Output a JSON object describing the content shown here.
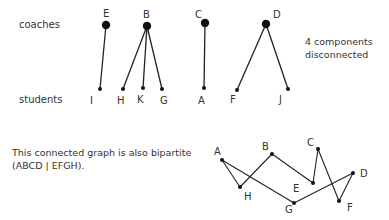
{
  "top": {
    "row_labels": {
      "coaches": "coaches",
      "students": "students"
    },
    "note_lines": [
      "4 components",
      "disconnected"
    ],
    "components": [
      {
        "coach": "E",
        "students": [
          "I"
        ]
      },
      {
        "coach": "B",
        "students": [
          "H",
          "K",
          "G"
        ]
      },
      {
        "coach": "C",
        "students": [
          "A"
        ]
      },
      {
        "coach": "D",
        "students": [
          "F",
          "J"
        ]
      }
    ],
    "node_labels": {
      "E": "E",
      "B": "B",
      "C": "C",
      "D": "D",
      "I": "I",
      "H": "H",
      "K": "K",
      "G": "G",
      "A": "A",
      "F": "F",
      "J": "J"
    }
  },
  "bottom": {
    "caption_lines": [
      "This connected graph is also bipartite",
      "(ABCD | EFGH)."
    ],
    "node_labels": {
      "A": "A",
      "B": "B",
      "C": "C",
      "D": "D",
      "E": "E",
      "F": "F",
      "G": "G",
      "H": "H"
    },
    "edges": [
      [
        "A",
        "H"
      ],
      [
        "A",
        "G"
      ],
      [
        "H",
        "B"
      ],
      [
        "B",
        "E"
      ],
      [
        "E",
        "C"
      ],
      [
        "C",
        "F"
      ],
      [
        "F",
        "D"
      ],
      [
        "D",
        "G"
      ]
    ]
  },
  "colors": {
    "ink": "#222222",
    "text": "#333333"
  }
}
